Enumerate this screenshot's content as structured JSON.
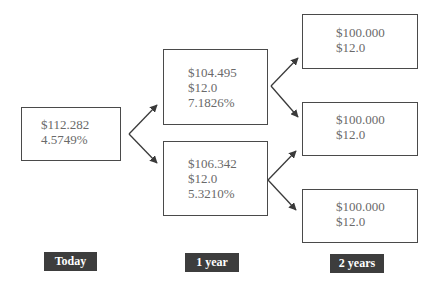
{
  "tree": {
    "today": {
      "lines": [
        "$112.282",
        "4.5749%"
      ]
    },
    "year1": {
      "up": {
        "lines": [
          "$104.495",
          "$12.0",
          "7.1826%"
        ]
      },
      "down": {
        "lines": [
          "$106.342",
          "$12.0",
          "5.3210%"
        ]
      }
    },
    "year2": {
      "up": {
        "lines": [
          "$100.000",
          "$12.0"
        ]
      },
      "mid": {
        "lines": [
          "$100.000",
          "$12.0"
        ]
      },
      "down": {
        "lines": [
          "$100.000",
          "$12.0"
        ]
      }
    }
  },
  "periods": {
    "today": "Today",
    "year1": "1 year",
    "year2": "2 years"
  },
  "colors": {
    "box_border": "#4a4a4a",
    "text": "#6a6a6a",
    "label_bg": "#3d3d3d",
    "label_text": "#ffffff",
    "arrow": "#3a3a3a"
  }
}
